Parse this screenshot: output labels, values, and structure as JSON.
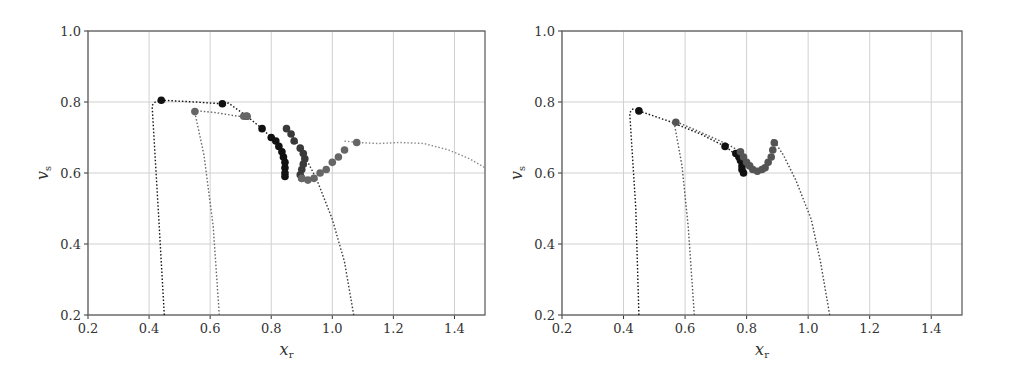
{
  "chart_data": [
    {
      "type": "scatter",
      "title": "",
      "xlabel": "x_r",
      "ylabel": "v_s",
      "xlim": [
        0.2,
        1.5
      ],
      "ylim": [
        0.2,
        1.0
      ],
      "xticks": [
        "0.2",
        "0.4",
        "0.6",
        "0.8",
        "1.0",
        "1.2",
        "1.4"
      ],
      "yticks": [
        "0.2",
        "0.4",
        "0.6",
        "0.8",
        "1.0"
      ],
      "grid": true,
      "legend": null,
      "series": [
        {
          "name": "trajectory-black",
          "color": "#111111",
          "line": [
            [
              0.45,
              0.2
            ],
            [
              0.43,
              0.5
            ],
            [
              0.41,
              0.79
            ],
            [
              0.42,
              0.8
            ],
            [
              0.44,
              0.805
            ],
            [
              0.55,
              0.8
            ],
            [
              0.64,
              0.795
            ],
            [
              0.66,
              0.797
            ],
            [
              0.72,
              0.76
            ],
            [
              0.77,
              0.725
            ],
            [
              0.8,
              0.7
            ],
            [
              0.82,
              0.685
            ],
            [
              0.835,
              0.66
            ],
            [
              0.84,
              0.64
            ],
            [
              0.845,
              0.62
            ],
            [
              0.845,
              0.59
            ]
          ],
          "markers": [
            [
              0.44,
              0.805
            ],
            [
              0.64,
              0.795
            ],
            [
              0.72,
              0.76
            ],
            [
              0.77,
              0.725
            ],
            [
              0.8,
              0.7
            ],
            [
              0.815,
              0.69
            ],
            [
              0.825,
              0.675
            ],
            [
              0.835,
              0.66
            ],
            [
              0.84,
              0.645
            ],
            [
              0.845,
              0.63
            ],
            [
              0.845,
              0.615
            ],
            [
              0.845,
              0.6
            ],
            [
              0.845,
              0.59
            ]
          ]
        },
        {
          "name": "trajectory-dark-gray",
          "color": "#3a3a3a",
          "line": [
            [
              1.07,
              0.2
            ],
            [
              1.04,
              0.35
            ],
            [
              1.0,
              0.47
            ],
            [
              0.95,
              0.58
            ],
            [
              0.92,
              0.63
            ],
            [
              0.9,
              0.67
            ],
            [
              0.88,
              0.69
            ],
            [
              0.865,
              0.71
            ],
            [
              0.85,
              0.725
            ]
          ],
          "markers": [
            [
              0.85,
              0.725
            ],
            [
              0.865,
              0.71
            ],
            [
              0.875,
              0.69
            ],
            [
              0.895,
              0.67
            ],
            [
              0.905,
              0.655
            ],
            [
              0.91,
              0.64
            ],
            [
              0.905,
              0.625
            ],
            [
              0.9,
              0.61
            ],
            [
              0.895,
              0.595
            ],
            [
              0.9,
              0.585
            ]
          ]
        },
        {
          "name": "trajectory-gray",
          "color": "#666666",
          "line": [
            [
              0.63,
              0.2
            ],
            [
              0.61,
              0.45
            ],
            [
              0.58,
              0.65
            ],
            [
              0.55,
              0.77
            ],
            [
              0.56,
              0.775
            ],
            [
              0.62,
              0.77
            ],
            [
              0.69,
              0.76
            ],
            [
              0.73,
              0.76
            ]
          ],
          "markers": [
            [
              0.55,
              0.773
            ],
            [
              0.71,
              0.76
            ],
            [
              0.72,
              0.76
            ],
            [
              0.9,
              0.585
            ],
            [
              0.92,
              0.58
            ],
            [
              0.94,
              0.585
            ],
            [
              0.96,
              0.6
            ],
            [
              0.98,
              0.61
            ],
            [
              1.0,
              0.63
            ],
            [
              1.02,
              0.645
            ],
            [
              1.04,
              0.665
            ],
            [
              1.08,
              0.686
            ]
          ]
        },
        {
          "name": "trajectory-light-gray",
          "color": "#8a8a8a",
          "line": [
            [
              1.04,
              0.69
            ],
            [
              1.08,
              0.686
            ],
            [
              1.15,
              0.683
            ],
            [
              1.22,
              0.686
            ],
            [
              1.3,
              0.683
            ],
            [
              1.38,
              0.665
            ],
            [
              1.45,
              0.64
            ],
            [
              1.5,
              0.615
            ]
          ],
          "markers": []
        }
      ]
    },
    {
      "type": "scatter",
      "title": "",
      "xlabel": "x_r",
      "ylabel": "v_s",
      "xlim": [
        0.2,
        1.5
      ],
      "ylim": [
        0.2,
        1.0
      ],
      "xticks": [
        "0.2",
        "0.4",
        "0.6",
        "0.8",
        "1.0",
        "1.2",
        "1.4"
      ],
      "yticks": [
        "0.2",
        "0.4",
        "0.6",
        "0.8",
        "1.0"
      ],
      "grid": true,
      "legend": null,
      "series": [
        {
          "name": "trajectory-black",
          "color": "#111111",
          "line": [
            [
              0.45,
              0.2
            ],
            [
              0.44,
              0.5
            ],
            [
              0.42,
              0.77
            ],
            [
              0.43,
              0.78
            ],
            [
              0.45,
              0.775
            ],
            [
              0.55,
              0.745
            ],
            [
              0.65,
              0.71
            ],
            [
              0.73,
              0.675
            ],
            [
              0.76,
              0.655
            ],
            [
              0.78,
              0.64
            ],
            [
              0.785,
              0.62
            ],
            [
              0.79,
              0.6
            ]
          ],
          "markers": [
            [
              0.45,
              0.775
            ],
            [
              0.73,
              0.675
            ],
            [
              0.765,
              0.655
            ],
            [
              0.775,
              0.645
            ],
            [
              0.78,
              0.635
            ],
            [
              0.785,
              0.62
            ],
            [
              0.785,
              0.61
            ],
            [
              0.79,
              0.6
            ]
          ]
        },
        {
          "name": "trajectory-gray",
          "color": "#555555",
          "line": [
            [
              0.63,
              0.2
            ],
            [
              0.61,
              0.45
            ],
            [
              0.59,
              0.62
            ],
            [
              0.565,
              0.74
            ],
            [
              0.57,
              0.745
            ],
            [
              0.65,
              0.715
            ],
            [
              0.74,
              0.68
            ],
            [
              0.78,
              0.66
            ]
          ],
          "markers": [
            [
              0.57,
              0.743
            ],
            [
              0.78,
              0.66
            ],
            [
              0.79,
              0.645
            ],
            [
              0.8,
              0.63
            ],
            [
              0.81,
              0.62
            ],
            [
              0.82,
              0.61
            ],
            [
              0.835,
              0.605
            ],
            [
              0.85,
              0.61
            ],
            [
              0.86,
              0.615
            ],
            [
              0.87,
              0.63
            ],
            [
              0.88,
              0.645
            ],
            [
              0.885,
              0.665
            ],
            [
              0.89,
              0.685
            ]
          ]
        },
        {
          "name": "trajectory-dark-gray",
          "color": "#444444",
          "line": [
            [
              1.07,
              0.2
            ],
            [
              1.04,
              0.35
            ],
            [
              1.01,
              0.47
            ],
            [
              0.96,
              0.58
            ],
            [
              0.92,
              0.65
            ],
            [
              0.89,
              0.69
            ],
            [
              0.88,
              0.695
            ]
          ],
          "markers": []
        }
      ]
    }
  ]
}
